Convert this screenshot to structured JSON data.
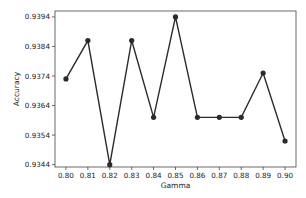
{
  "chart_data": {
    "type": "line",
    "title": "",
    "xlabel": "Gamma",
    "ylabel": "Accuracy",
    "x": [
      0.8,
      0.81,
      0.82,
      0.83,
      0.84,
      0.85,
      0.86,
      0.87,
      0.88,
      0.89,
      0.9
    ],
    "x_tick_labels": [
      "0.80",
      "0.81",
      "0.82",
      "0.83",
      "0.84",
      "0.85",
      "0.86",
      "0.87",
      "0.88",
      "0.89",
      "0.90"
    ],
    "y_ticks": [
      0.9344,
      0.9354,
      0.9364,
      0.9374,
      0.9384,
      0.9394
    ],
    "y_tick_labels": [
      "0.9344",
      "0.9354",
      "0.9364",
      "0.9374",
      "0.9384",
      "0.9394"
    ],
    "series": [
      {
        "name": "Accuracy",
        "values": [
          0.9373,
          0.9386,
          0.9344,
          0.9386,
          0.936,
          0.9394,
          0.936,
          0.936,
          0.936,
          0.9375,
          0.9352
        ],
        "color": "#2b2b2b",
        "marker": "circle"
      }
    ],
    "xlim": [
      0.795,
      0.905
    ],
    "ylim": [
      0.93432,
      0.9396
    ],
    "grid": false,
    "legend": "none"
  }
}
